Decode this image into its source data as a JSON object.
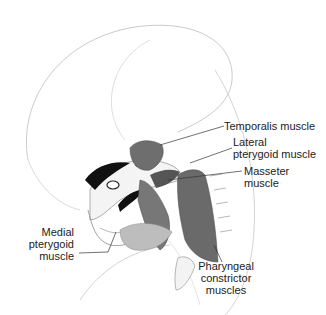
{
  "figure": {
    "labels": [
      {
        "id": "temporalis",
        "text": "Temporalis muscle"
      },
      {
        "id": "lateral_pterygoid_1",
        "text": "Lateral"
      },
      {
        "id": "lateral_pterygoid_2",
        "text": "pterygoid muscle"
      },
      {
        "id": "masseter_1",
        "text": "Masseter"
      },
      {
        "id": "masseter_2",
        "text": "muscle"
      },
      {
        "id": "medial_pterygoid_1",
        "text": "Medial"
      },
      {
        "id": "medial_pterygoid_2",
        "text": "pterygoid"
      },
      {
        "id": "medial_pterygoid_3",
        "text": "muscle"
      },
      {
        "id": "pharyngeal_1",
        "text": "Pharyngeal"
      },
      {
        "id": "pharyngeal_2",
        "text": "constrictor"
      },
      {
        "id": "pharyngeal_3",
        "text": "muscles"
      }
    ],
    "colors": {
      "muscle": "#6e6e6e",
      "muscle_dark": "#3a3a3a",
      "outline": "#9a9a9a",
      "bone_dark": "#111111",
      "leader": "#333333"
    }
  }
}
